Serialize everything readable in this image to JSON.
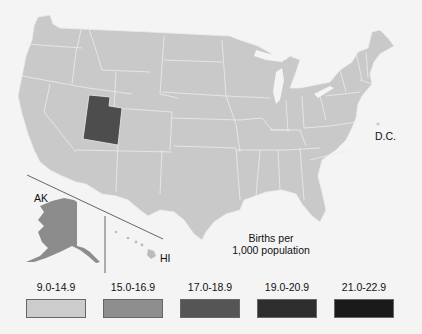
{
  "map": {
    "title_line1": "Births per",
    "title_line2": "1,000 population",
    "labels": {
      "alaska": "AK",
      "hawaii": "HI",
      "dc": "D.C."
    },
    "highlighted": [
      {
        "state": "Utah",
        "bin": "17.0-18.9",
        "color": "#4d4d4d"
      },
      {
        "state": "Alaska",
        "bin": "15.0-16.9",
        "color": "#8c8c8c"
      }
    ],
    "default_fill": "#c9c9c9"
  },
  "legend": [
    {
      "label": "9.0-14.9",
      "color": "#cccccc"
    },
    {
      "label": "15.0-16.9",
      "color": "#8e8e8e"
    },
    {
      "label": "17.0-18.9",
      "color": "#555555"
    },
    {
      "label": "19.0-20.9",
      "color": "#2e2e2e"
    },
    {
      "label": "21.0-22.9",
      "color": "#1a1a1a"
    }
  ]
}
